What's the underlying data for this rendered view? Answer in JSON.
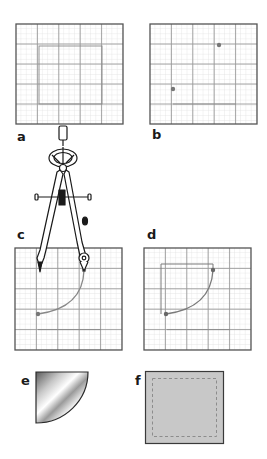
{
  "panels": [
    {
      "id": "a",
      "label": "a",
      "description": "Empty grid with marked square region"
    },
    {
      "id": "b",
      "label": "b",
      "description": "Grid with two marked points"
    },
    {
      "id": "c",
      "label": "c",
      "description": "Compass drawing quarter-circle arc between two points"
    },
    {
      "id": "d",
      "label": "d",
      "description": "Quarter-circle arc with square outline"
    },
    {
      "id": "e",
      "label": "e",
      "description": "Cut-out quarter-circle metallic shape"
    },
    {
      "id": "f",
      "label": "f",
      "description": "Gray square with dashed inset border"
    }
  ],
  "colors": {
    "grid_minor": "#d6d6d6",
    "grid_major": "#9a9a9a",
    "grid_border": "#555555",
    "point": "#777777",
    "arc": "#888888",
    "square_fill": "#c8c8c8",
    "dash": "#8c8c8c",
    "ink": "#1a1a1a"
  },
  "grid": {
    "major_divisions": 5,
    "minor_per_major": 4
  }
}
